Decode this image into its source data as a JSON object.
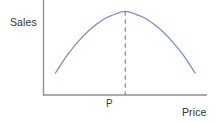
{
  "chart_data": {
    "type": "line",
    "title": "",
    "subtitle": "",
    "xlabel": "Price",
    "ylabel": "Sales",
    "grid": false,
    "legend": null,
    "axis_style": "two-axis L-shape, no tick marks, no numeric scale",
    "xlim": [
      0,
      1
    ],
    "ylim": [
      0,
      1
    ],
    "series": [
      {
        "name": "Sales vs Price",
        "shape": "inverted parabola",
        "color": "#7b8fc4",
        "x": [
          0.073,
          0.146,
          0.22,
          0.293,
          0.366,
          0.41,
          0.5,
          0.59,
          0.634,
          0.707,
          0.78,
          0.854,
          0.927
        ],
        "y": [
          0.247,
          0.45,
          0.617,
          0.75,
          0.848,
          0.888,
          0.94,
          0.888,
          0.848,
          0.75,
          0.617,
          0.45,
          0.247
        ]
      }
    ],
    "annotations": [
      {
        "name": "peak-dashed-line",
        "type": "vertical-dashed-line",
        "x": 0.5,
        "y_from": 0.0,
        "y_to": 0.94,
        "color": "#8a8a8a",
        "label": "P"
      }
    ],
    "tick_labels": {
      "x": [
        "P"
      ],
      "y": []
    }
  },
  "labels": {
    "y_axis": "Sales",
    "x_axis": "Price",
    "optimum_point": "P"
  },
  "colors": {
    "curve": "#7b8fc4",
    "axis": "#8f8f8f",
    "dashed_line": "#8a8a8a",
    "text": "#333333",
    "background": "#ffffff"
  }
}
